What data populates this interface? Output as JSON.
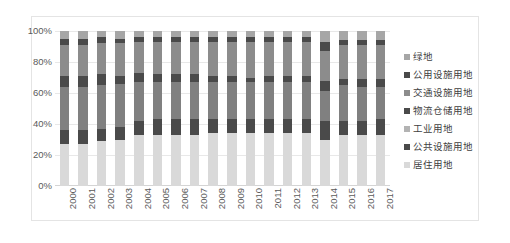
{
  "chart_data": {
    "type": "bar",
    "subtype": "100% stacked bar",
    "title": "",
    "xlabel": "",
    "ylabel": "",
    "ylim": [
      0,
      100
    ],
    "yticks": [
      "0%",
      "20%",
      "40%",
      "60%",
      "80%",
      "100%"
    ],
    "ytick_values": [
      0,
      20,
      40,
      60,
      80,
      100
    ],
    "grid": true,
    "legend_position": "right",
    "categories": [
      "2000",
      "2001",
      "2002",
      "2003",
      "2004",
      "2005",
      "2006",
      "2007",
      "2008",
      "2009",
      "2010",
      "2011",
      "2012",
      "2013",
      "2014",
      "2015",
      "2016",
      "2017"
    ],
    "series": [
      {
        "name": "居住用地",
        "color": "#d9d9d9",
        "values": [
          27,
          27,
          29,
          30,
          33,
          33,
          33,
          33,
          34,
          34,
          34,
          34,
          34,
          34,
          30,
          33,
          33,
          33
        ]
      },
      {
        "name": "公共设施用地",
        "color": "#4a4a4a",
        "values": [
          9,
          9,
          8,
          8,
          9,
          10,
          10,
          10,
          9,
          9,
          9,
          9,
          9,
          9,
          12,
          9,
          9,
          10
        ]
      },
      {
        "name": "工业用地",
        "color": "#808080",
        "values": [
          28,
          28,
          28,
          28,
          25,
          24,
          24,
          24,
          24,
          24,
          24,
          24,
          24,
          24,
          19,
          23,
          22,
          21
        ]
      },
      {
        "name": "物流仓储用地",
        "color": "#4a4a4a",
        "values": [
          7,
          7,
          7,
          5,
          6,
          5,
          5,
          5,
          4,
          4,
          3,
          4,
          4,
          4,
          7,
          4,
          5,
          5
        ]
      },
      {
        "name": "交通设施用地",
        "color": "#8c8c8c",
        "values": [
          20,
          20,
          20,
          21,
          20,
          21,
          21,
          21,
          22,
          22,
          23,
          22,
          22,
          22,
          19,
          22,
          22,
          22
        ]
      },
      {
        "name": "公用设施用地",
        "color": "#4a4a4a",
        "values": [
          4,
          4,
          4,
          3,
          3,
          3,
          3,
          3,
          3,
          3,
          3,
          3,
          3,
          3,
          6,
          3,
          3,
          3
        ]
      },
      {
        "name": "绿地",
        "color": "#a6a6a6",
        "values": [
          5,
          5,
          4,
          5,
          4,
          4,
          4,
          4,
          4,
          4,
          4,
          4,
          4,
          4,
          7,
          6,
          6,
          6
        ]
      }
    ]
  },
  "legend": {
    "items": [
      {
        "label": "绿地",
        "color": "#a6a6a6"
      },
      {
        "label": "公用设施用地",
        "color": "#4a4a4a"
      },
      {
        "label": "交通设施用地",
        "color": "#8c8c8c"
      },
      {
        "label": "物流仓储用地",
        "color": "#4a4a4a"
      },
      {
        "label": "工业用地",
        "color": "#b3b3b3"
      },
      {
        "label": "公共设施用地",
        "color": "#4a4a4a"
      },
      {
        "label": "居住用地",
        "color": "#d9d9d9"
      }
    ]
  }
}
